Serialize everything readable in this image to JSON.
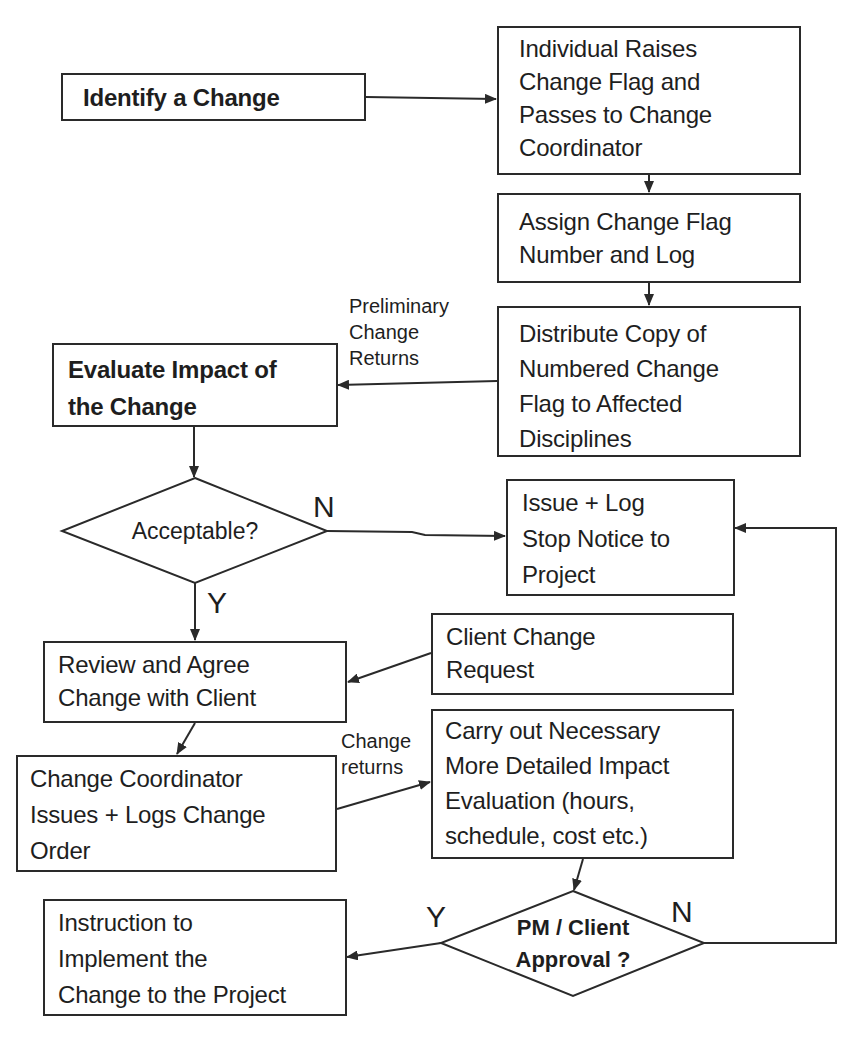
{
  "diagram": {
    "type": "flowchart",
    "colors": {
      "stroke": "#2a2a2a",
      "text": "#1e1e1e",
      "background": "#ffffff"
    },
    "nodes": {
      "identify": {
        "shape": "rectangle",
        "bold": true,
        "lines": [
          "Identify a Change"
        ]
      },
      "raise_flag": {
        "shape": "rectangle",
        "lines": [
          "Individual Raises",
          "Change Flag and",
          "Passes to Change",
          "Coordinator"
        ]
      },
      "assign_number": {
        "shape": "rectangle",
        "lines": [
          "Assign Change Flag",
          "Number and Log"
        ]
      },
      "distribute": {
        "shape": "rectangle",
        "lines": [
          "Distribute Copy of",
          "Numbered Change",
          "Flag to Affected",
          "Disciplines"
        ]
      },
      "evaluate": {
        "shape": "rectangle",
        "bold": true,
        "lines": [
          "Evaluate Impact of",
          "the Change"
        ]
      },
      "acceptable": {
        "shape": "diamond",
        "lines": [
          "Acceptable?"
        ]
      },
      "stop_notice": {
        "shape": "rectangle",
        "lines": [
          "Issue + Log",
          "Stop Notice to",
          "Project"
        ]
      },
      "client_request": {
        "shape": "rectangle",
        "lines": [
          "Client Change",
          "Request"
        ]
      },
      "review_agree": {
        "shape": "rectangle",
        "lines": [
          "Review and Agree",
          "Change with Client"
        ]
      },
      "detailed_eval": {
        "shape": "rectangle",
        "lines": [
          "Carry out Necessary",
          "More Detailed Impact",
          "Evaluation (hours,",
          "schedule, cost etc.)"
        ]
      },
      "change_order": {
        "shape": "rectangle",
        "lines": [
          "Change Coordinator",
          "Issues + Logs Change",
          "Order"
        ]
      },
      "approval": {
        "shape": "diamond",
        "bold": true,
        "lines": [
          "PM / Client",
          "Approval ?"
        ]
      },
      "implement": {
        "shape": "rectangle",
        "lines": [
          "Instruction to",
          "Implement the",
          "Change to the Project"
        ]
      }
    },
    "edge_labels": {
      "preliminary": [
        "Preliminary",
        "Change",
        "Returns"
      ],
      "change_returns": [
        "Change",
        "returns"
      ],
      "acceptable_no": "N",
      "acceptable_yes": "Y",
      "approval_yes": "Y",
      "approval_no": "N"
    },
    "edges": [
      {
        "from": "identify",
        "to": "raise_flag"
      },
      {
        "from": "raise_flag",
        "to": "assign_number"
      },
      {
        "from": "assign_number",
        "to": "distribute"
      },
      {
        "from": "distribute",
        "to": "evaluate",
        "label": "Preliminary Change Returns"
      },
      {
        "from": "evaluate",
        "to": "acceptable"
      },
      {
        "from": "acceptable",
        "to": "stop_notice",
        "label": "N"
      },
      {
        "from": "acceptable",
        "to": "review_agree",
        "label": "Y"
      },
      {
        "from": "client_request",
        "to": "review_agree"
      },
      {
        "from": "review_agree",
        "to": "change_order"
      },
      {
        "from": "change_order",
        "to": "detailed_eval",
        "label": "Change returns"
      },
      {
        "from": "detailed_eval",
        "to": "approval"
      },
      {
        "from": "approval",
        "to": "implement",
        "label": "Y"
      },
      {
        "from": "approval",
        "to": "stop_notice",
        "label": "N"
      }
    ]
  }
}
